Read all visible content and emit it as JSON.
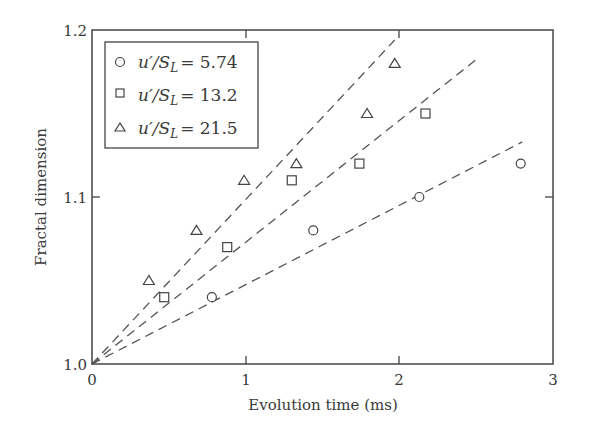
{
  "chart_data": {
    "type": "scatter",
    "title": "",
    "xlabel": "Evolution time (ms)",
    "ylabel": "Fractal dimension",
    "xlim": [
      0,
      3
    ],
    "ylim": [
      1.0,
      1.2
    ],
    "x_ticks": [
      "0",
      "1",
      "2",
      "3"
    ],
    "y_ticks": [
      "1.0",
      "1.1",
      "1.2"
    ],
    "grid": false,
    "legend_position": "upper left",
    "series": [
      {
        "name": "u'/S_L = 5.74",
        "marker": "circle",
        "points": [
          [
            0.78,
            1.04
          ],
          [
            1.44,
            1.08
          ],
          [
            2.13,
            1.1
          ],
          [
            2.79,
            1.12
          ]
        ],
        "fit_line": {
          "style": "dashed",
          "from": [
            0,
            1.0
          ],
          "to": [
            2.8,
            1.133
          ]
        }
      },
      {
        "name": "u'/S_L = 13.2",
        "marker": "square",
        "points": [
          [
            0.47,
            1.04
          ],
          [
            0.88,
            1.07
          ],
          [
            1.3,
            1.11
          ],
          [
            1.74,
            1.12
          ],
          [
            2.17,
            1.15
          ]
        ],
        "fit_line": {
          "style": "dashed",
          "from": [
            0,
            1.0
          ],
          "to": [
            2.51,
            1.183
          ]
        }
      },
      {
        "name": "u'/S_L = 21.5",
        "marker": "triangle",
        "points": [
          [
            0.37,
            1.05
          ],
          [
            0.68,
            1.08
          ],
          [
            0.99,
            1.11
          ],
          [
            1.33,
            1.12
          ],
          [
            1.79,
            1.15
          ],
          [
            1.97,
            1.18
          ]
        ],
        "fit_line": {
          "style": "dashed",
          "from": [
            0,
            1.0
          ],
          "to": [
            1.97,
            1.194
          ]
        }
      }
    ]
  },
  "legend": {
    "items": [
      {
        "prefix": "u′/S",
        "sub": "L",
        "value": "= 5.74"
      },
      {
        "prefix": "u′/S",
        "sub": "L",
        "value": "= 13.2"
      },
      {
        "prefix": "u′/S",
        "sub": "L",
        "value": "= 21.5"
      }
    ]
  },
  "axes": {
    "x_title": "Evolution time (ms)",
    "y_title": "Fractal dimension",
    "x_ticks": [
      "0",
      "1",
      "2",
      "3"
    ],
    "y_ticks": [
      "1.0",
      "1.1",
      "1.2"
    ]
  }
}
